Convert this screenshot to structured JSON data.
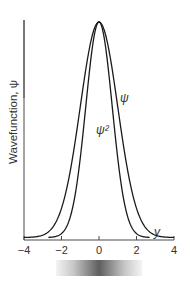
{
  "chart_data": {
    "type": "line",
    "title": "",
    "xlabel": "y",
    "ylabel": "Wavefunction, ψ",
    "xlim": [
      -4,
      4
    ],
    "ylim": [
      0,
      1
    ],
    "x_ticks": [
      -4,
      -2,
      0,
      2,
      4
    ],
    "x_tick_labels": [
      "−4",
      "−2",
      "0",
      "2",
      "4"
    ],
    "grid": false,
    "legend": "none",
    "series": [
      {
        "name": "ψ",
        "label": "ψ",
        "function": "exp(-y^2/2)",
        "x": [
          -4,
          -3.5,
          -3,
          -2.5,
          -2,
          -1.5,
          -1,
          -0.5,
          0,
          0.5,
          1,
          1.5,
          2,
          2.5,
          3,
          3.5,
          4
        ],
        "values": [
          0.0003,
          0.0022,
          0.0111,
          0.0439,
          0.1353,
          0.3247,
          0.6065,
          0.8825,
          1.0,
          0.8825,
          0.6065,
          0.3247,
          0.1353,
          0.0439,
          0.0111,
          0.0022,
          0.0003
        ]
      },
      {
        "name": "ψ²",
        "label": "ψ²",
        "function": "exp(-y^2)",
        "x": [
          -2.7,
          -2.5,
          -2,
          -1.5,
          -1,
          -0.5,
          0,
          0.5,
          1,
          1.5,
          2,
          2.5,
          2.7
        ],
        "values": [
          0.0007,
          0.0019,
          0.0183,
          0.1054,
          0.3679,
          0.7788,
          1.0,
          0.7788,
          0.3679,
          0.1054,
          0.0183,
          0.0019,
          0.0007
        ]
      }
    ],
    "annotations": [
      {
        "text": "ψ",
        "near_series": "ψ",
        "side": "right"
      },
      {
        "text": "ψ²",
        "near_series": "ψ²",
        "side": "inside"
      }
    ],
    "density_bar": {
      "description": "grayscale probability density strip beneath x-axis, darkest at y = 0",
      "range": [
        -2.3,
        2.3
      ],
      "color_peak": "#5a5a5a",
      "color_edge": "#f2f2f2"
    },
    "colors": {
      "curve": "#1a1a1a",
      "axis": "#4a4a4a",
      "text": "#333333"
    }
  }
}
